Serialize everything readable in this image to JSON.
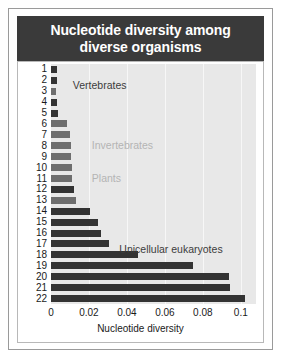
{
  "figure": {
    "title": "Nucleotide diversity among diverse organisms",
    "title_line1": "Nucleotide diversity among",
    "title_line2": "diverse organisms",
    "title_bg_color": "#3a3a3a",
    "title_text_color": "#ffffff",
    "plot_bg_color": "#e8e8e8"
  },
  "chart_data": {
    "type": "bar",
    "orientation": "horizontal",
    "title": "Nucleotide diversity among diverse organisms",
    "xlabel": "Nucleotide diversity",
    "ylabel": "",
    "xlim": [
      0,
      0.108
    ],
    "ylim": [
      22.5,
      0.5
    ],
    "grid": true,
    "grid_axis": "x",
    "legend": "none",
    "xticks": [
      0,
      0.02,
      0.04,
      0.06,
      0.08,
      0.1
    ],
    "xticklabels": [
      "0",
      "0.02",
      "0.04",
      "0.06",
      "0.08",
      "0.1"
    ],
    "categories": [
      "1",
      "2",
      "3",
      "4",
      "5",
      "6",
      "7",
      "8",
      "9",
      "10",
      "11",
      "12",
      "13",
      "14",
      "15",
      "16",
      "17",
      "18",
      "19",
      "20",
      "21",
      "22"
    ],
    "values": [
      0.003,
      0.0031,
      0.0027,
      0.0034,
      0.0037,
      0.0082,
      0.0102,
      0.0105,
      0.0107,
      0.011,
      0.0112,
      0.0122,
      0.0133,
      0.0204,
      0.0245,
      0.0265,
      0.0306,
      0.0458,
      0.0748,
      0.094,
      0.0942,
      0.102
    ],
    "bar_shades": [
      "dark",
      "dark",
      "mid",
      "dark",
      "dark",
      "mid",
      "mid",
      "mid",
      "mid",
      "mid",
      "mid",
      "dark",
      "mid",
      "dark",
      "dark",
      "dark",
      "dark",
      "dark",
      "dark",
      "dark",
      "dark",
      "dark"
    ],
    "annotations": [
      {
        "text": "Vertebrates",
        "x": 0.0115,
        "y": 1.6,
        "color": "#3c3c3c"
      },
      {
        "text": "Invertebrates",
        "x": 0.0215,
        "y": 7.1,
        "color": "#b4b4b4"
      },
      {
        "text": "Plants",
        "x": 0.0215,
        "y": 10.1,
        "color": "#b4b4b4"
      },
      {
        "text": "Unicellular eukaryotes",
        "x": 0.036,
        "y": 16.6,
        "color": "#3c3c3c"
      }
    ]
  }
}
